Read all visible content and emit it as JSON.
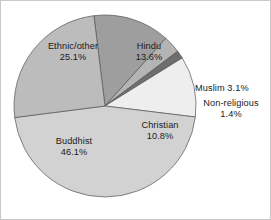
{
  "chart_data": {
    "type": "pie",
    "title": "",
    "subtitle": "",
    "xlabel": "",
    "ylabel": "",
    "legend_position": "none",
    "grid": false,
    "units": "percent",
    "labels": [
      "Hindu",
      "Muslim",
      "Non-religious",
      "Christian",
      "Buddhist",
      "Ethnic/other"
    ],
    "values": [
      13.6,
      3.1,
      1.4,
      10.8,
      46.1,
      25.1
    ],
    "slices": [
      {
        "name": "Hindu",
        "value": 13.6,
        "value_text": "13.6%",
        "color": "#9e9e9e",
        "label_placement": "inside",
        "label_lines": 2
      },
      {
        "name": "Muslim",
        "value": 3.1,
        "value_text": "3.1%",
        "color": "#b4b4b4",
        "label_placement": "outside-right",
        "label_lines": 1
      },
      {
        "name": "Non-religious",
        "value": 1.4,
        "value_text": "1.4%",
        "color": "#6e6e6e",
        "label_placement": "outside-right",
        "label_lines": 2
      },
      {
        "name": "Christian",
        "value": 10.8,
        "value_text": "10.8%",
        "color": "#eeeeee",
        "label_placement": "inside",
        "label_lines": 2
      },
      {
        "name": "Buddhist",
        "value": 46.1,
        "value_text": "46.1%",
        "color": "#d2d2d2",
        "label_placement": "inside",
        "label_lines": 2
      },
      {
        "name": "Ethnic/other",
        "value": 25.1,
        "value_text": "25.1%",
        "color": "#bcbcbc",
        "label_placement": "inside",
        "label_lines": 2
      }
    ],
    "geometry": {
      "center_x": 104,
      "center_y": 105,
      "radius": 91,
      "start_angle_deg": -7
    },
    "style": {
      "background": "#ffffff",
      "border_color": "#c8c8c8",
      "slice_outline": "#555555",
      "label_color": "#1a1a1a"
    }
  }
}
